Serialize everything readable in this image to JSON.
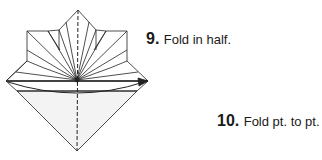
{
  "steps": [
    {
      "number": "9.",
      "instruction": "Fold in half."
    },
    {
      "number": "10.",
      "instruction": "Fold pt. to pt."
    }
  ],
  "diagram": {
    "stroke_color": "#222222",
    "fill_lower": "#f3f3f3",
    "fill_paper": "#ffffff"
  }
}
